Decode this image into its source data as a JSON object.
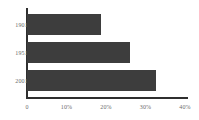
{
  "chart_data": {
    "type": "bar",
    "orientation": "horizontal",
    "title": "",
    "subtitle": "",
    "xlabel": "",
    "ylabel": "",
    "categories": [
      "1901",
      "1951",
      "2001"
    ],
    "values": [
      18.7,
      26.0,
      32.6
    ],
    "series": [
      {
        "name": "",
        "values": [
          18.7,
          26.0,
          32.6
        ]
      }
    ],
    "xlim": [
      0,
      40
    ],
    "xticks": [
      0,
      10,
      20,
      30,
      40
    ],
    "xticklabels": [
      "0",
      "10%",
      "20%",
      "30%",
      "40%"
    ],
    "grid": false,
    "legend": false,
    "legend_position": "none",
    "annotations": [],
    "colors": {
      "bar": "#3d3d3d",
      "axis": "#2f2f2f",
      "tick_label": "#6b6b6b",
      "background": "#ffffff"
    }
  }
}
